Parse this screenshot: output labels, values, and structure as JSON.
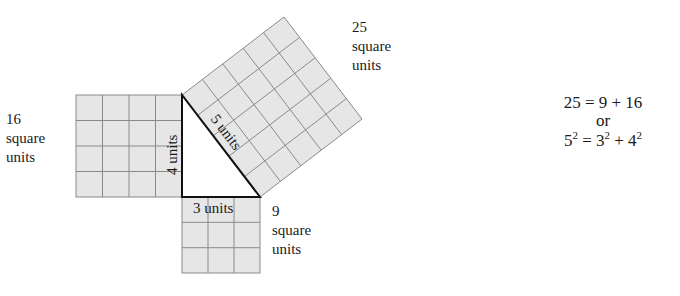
{
  "diagram": {
    "fill_color": "#e6e6e6",
    "grid_color": "#8a8a8a",
    "triangle_color": "#111111",
    "squares": [
      {
        "side": 4,
        "area": 16,
        "label_value": "16",
        "label_unit1": "square",
        "label_unit2": "units"
      },
      {
        "side": 3,
        "area": 9,
        "label_value": "9",
        "label_unit1": "square",
        "label_unit2": "units"
      },
      {
        "side": 5,
        "area": 25,
        "label_value": "25",
        "label_unit1": "square",
        "label_unit2": "units"
      }
    ],
    "sides": {
      "vertical": "4 units",
      "horizontal": "3 units",
      "hypotenuse": "5 units"
    }
  },
  "equations": {
    "line1": {
      "lhs": "25",
      "eq": "=",
      "a": "9",
      "plus": "+",
      "b": "16"
    },
    "or": "or",
    "line2": {
      "lhs_base": "5",
      "lhs_exp": "2",
      "eq": "=",
      "a_base": "3",
      "a_exp": "2",
      "plus": "+",
      "b_base": "4",
      "b_exp": "2"
    }
  }
}
